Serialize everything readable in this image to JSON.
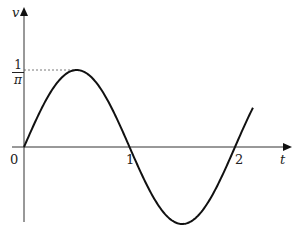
{
  "chart_data": {
    "type": "line",
    "title": "",
    "xlabel": "t",
    "ylabel": "v",
    "function": "v = (1/pi) * sin(pi * t)",
    "x_ticks": [
      "0",
      "1",
      "2"
    ],
    "y_ticks": [
      {
        "label_num": "1",
        "label_den": "π",
        "value": 0.3183
      }
    ],
    "xlim": [
      0,
      2.17
    ],
    "ylim": [
      -0.3183,
      0.3183
    ],
    "grid": false,
    "legend": null,
    "annotations": [
      "dashed guide line from v-axis at 1/π to curve peak at t=0.5"
    ],
    "series": [
      {
        "name": "v(t)",
        "x": [
          0,
          0.25,
          0.5,
          0.75,
          1.0,
          1.25,
          1.5,
          1.75,
          2.0,
          2.17
        ],
        "y": [
          0,
          0.225,
          0.3183,
          0.225,
          0,
          -0.225,
          -0.3183,
          -0.225,
          0,
          0.163
        ]
      }
    ]
  },
  "labels": {
    "y_axis": "v",
    "x_axis": "t",
    "origin": "0",
    "tick_1": "1",
    "tick_2": "2",
    "peak_num": "1",
    "peak_den": "π"
  },
  "colors": {
    "curve": "#111111",
    "axis": "#333333",
    "guide": "#555555"
  }
}
